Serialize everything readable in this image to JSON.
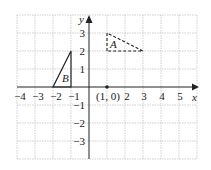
{
  "diagram": {
    "x_ticks": [
      "−4",
      "−3",
      "−2",
      "−1",
      "2",
      "3",
      "4",
      "5"
    ],
    "y_ticks": [
      "3",
      "2",
      "1",
      "−1",
      "−2",
      "−3"
    ],
    "x_label": "x",
    "y_label": "y",
    "point_label": "(1, 0)",
    "point": [
      1,
      0
    ],
    "triangle_A": {
      "label": "A",
      "vertices": [
        [
          1,
          2
        ],
        [
          1,
          3
        ],
        [
          3,
          2
        ]
      ],
      "style": "dashed"
    },
    "triangle_B": {
      "label": "B",
      "vertices": [
        [
          -2,
          0
        ],
        [
          -1,
          0
        ],
        [
          -1,
          2
        ]
      ],
      "style": "solid"
    },
    "colors": {
      "grid": "#bbbbbb",
      "axis": "#222222"
    }
  }
}
